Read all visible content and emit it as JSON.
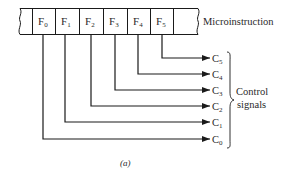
{
  "diagram": {
    "word_label": "Microinstruction",
    "fields": [
      {
        "label": "F",
        "sub": "0"
      },
      {
        "label": "F",
        "sub": "1"
      },
      {
        "label": "F",
        "sub": "2"
      },
      {
        "label": "F",
        "sub": "3"
      },
      {
        "label": "F",
        "sub": "4"
      },
      {
        "label": "F",
        "sub": "5"
      }
    ],
    "outputs": [
      {
        "label": "C",
        "sub": "5"
      },
      {
        "label": "C",
        "sub": "4"
      },
      {
        "label": "C",
        "sub": "3"
      },
      {
        "label": "C",
        "sub": "2"
      },
      {
        "label": "C",
        "sub": "1"
      },
      {
        "label": "C",
        "sub": "0"
      }
    ],
    "group_label_line1": "Control",
    "group_label_line2": "signals",
    "caption": "(a)",
    "colors": {
      "line": "#1a1a1a",
      "text": "#2a2a2a",
      "background": "#ffffff"
    }
  }
}
